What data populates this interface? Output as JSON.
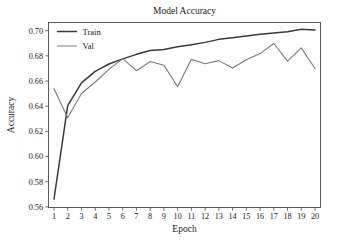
{
  "chart_data": {
    "type": "line",
    "title": "Model Accuracy",
    "xlabel": "Epoch",
    "ylabel": "Accuracy",
    "x": [
      1,
      2,
      3,
      4,
      5,
      6,
      7,
      8,
      9,
      10,
      11,
      12,
      13,
      14,
      15,
      16,
      17,
      18,
      19,
      20
    ],
    "xticklabels": [
      "1",
      "2",
      "3",
      "4",
      "5",
      "6",
      "7",
      "8",
      "9",
      "10",
      "11",
      "12",
      "13",
      "14",
      "15",
      "16",
      "17",
      "18",
      "19",
      "20"
    ],
    "yticklabels": [
      "0.56",
      "0.58",
      "0.60",
      "0.62",
      "0.64",
      "0.66",
      "0.68",
      "0.70"
    ],
    "yticks": [
      0.56,
      0.58,
      0.6,
      0.62,
      0.64,
      0.66,
      0.68,
      0.7
    ],
    "xlim": [
      0.6,
      20.4
    ],
    "ylim": [
      0.5595,
      0.7065
    ],
    "grid": false,
    "legend_position": "upper left",
    "series": [
      {
        "name": "Train",
        "color": "#3a3a3a",
        "linewidth": 1.5,
        "values": [
          0.5662,
          0.6405,
          0.6585,
          0.6677,
          0.6735,
          0.6776,
          0.6812,
          0.6842,
          0.6851,
          0.6872,
          0.6889,
          0.6907,
          0.6931,
          0.6944,
          0.6958,
          0.6972,
          0.6981,
          0.6992,
          0.7012,
          0.7005
        ]
      },
      {
        "name": "Val",
        "color": "#7c7c7c",
        "linewidth": 1.1,
        "values": [
          0.6538,
          0.6308,
          0.6501,
          0.6592,
          0.6692,
          0.6778,
          0.6682,
          0.6755,
          0.6726,
          0.6555,
          0.6772,
          0.6737,
          0.6762,
          0.6703,
          0.6769,
          0.6818,
          0.6898,
          0.6758,
          0.6863,
          0.6699
        ]
      }
    ]
  }
}
